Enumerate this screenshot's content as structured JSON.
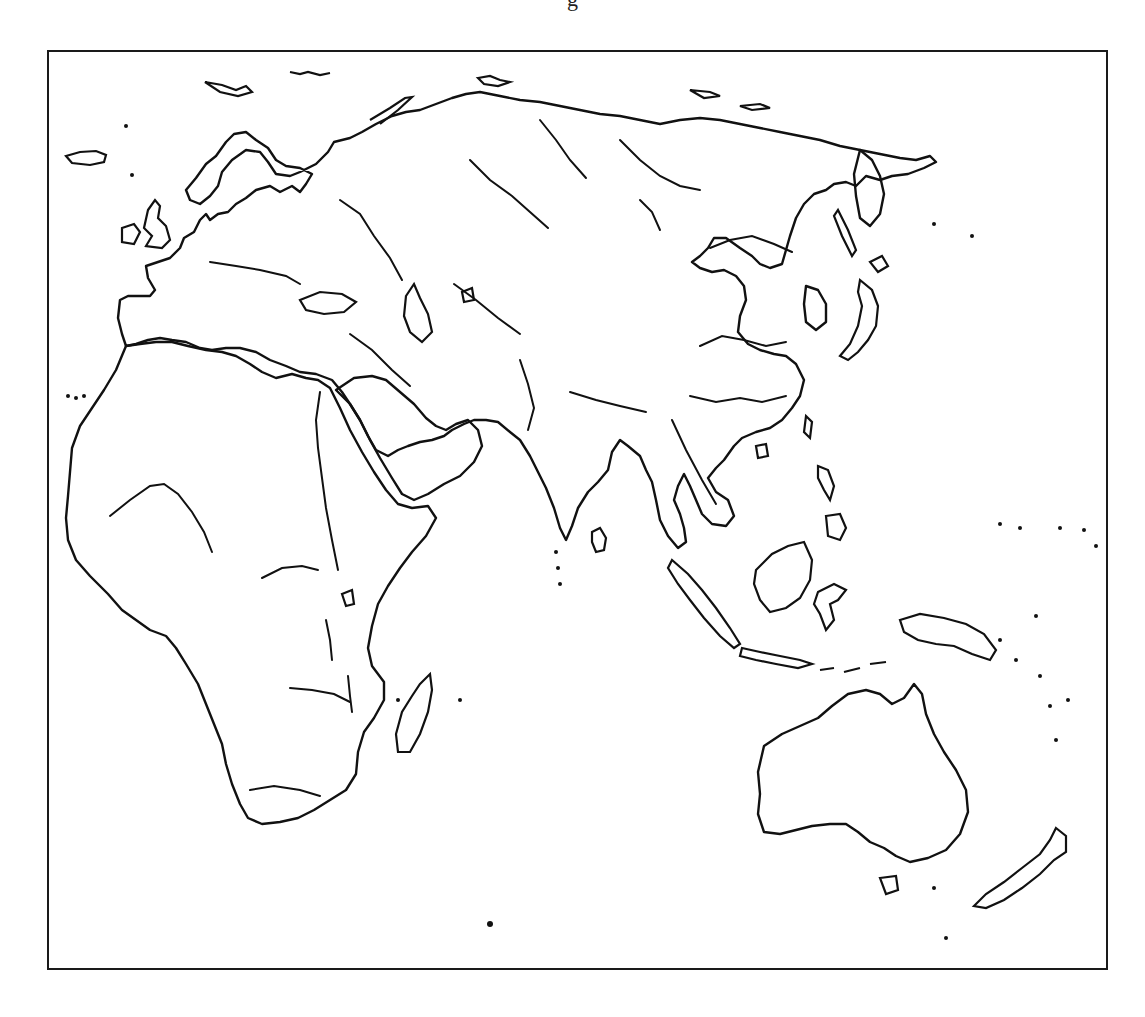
{
  "map": {
    "title_fragment": "g",
    "type": "outline-map",
    "region": "Eastern Hemisphere (Europe, Africa, Asia, Australia)",
    "projection": "equirectangular-like",
    "stroke_color": "#111111",
    "background_color": "#ffffff",
    "landmasses": [
      "Europe",
      "Asia",
      "Africa",
      "Australia",
      "Madagascar",
      "Japan",
      "Sri Lanka",
      "Borneo",
      "Sumatra",
      "New Guinea",
      "New Zealand",
      "Great Britain",
      "Iceland",
      "Tasmania"
    ],
    "features": [
      "coastlines",
      "major rivers",
      "lakes",
      "islands"
    ]
  }
}
